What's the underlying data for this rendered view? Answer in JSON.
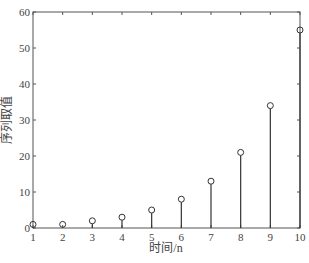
{
  "chart_data": {
    "type": "stem",
    "title": "",
    "xlabel": "时间/n",
    "ylabel": "序列取值",
    "x": [
      1,
      2,
      3,
      4,
      5,
      6,
      7,
      8,
      9,
      10
    ],
    "values": [
      1,
      1,
      2,
      3,
      5,
      8,
      13,
      21,
      34,
      55
    ],
    "xlim": [
      1,
      10
    ],
    "ylim": [
      0,
      60
    ],
    "xticks": [
      "1",
      "2",
      "3",
      "4",
      "5",
      "6",
      "7",
      "8",
      "9",
      "10"
    ],
    "yticks": [
      "0",
      "10",
      "20",
      "30",
      "40",
      "50",
      "60"
    ],
    "grid": false,
    "marker": "circle",
    "color": "#333333"
  }
}
